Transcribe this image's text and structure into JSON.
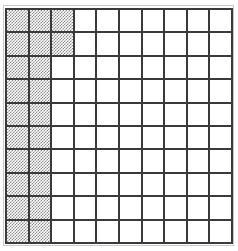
{
  "figure": {
    "type": "grid-area-model",
    "title": "",
    "columns": 10,
    "rows": 10,
    "total_cells": 100,
    "shaded_cells": 22,
    "unshaded_cells": 78,
    "fraction_shaded": "22/100",
    "decimal_shaded": "0.22",
    "percent_shaded": "22%"
  },
  "colors": {
    "grid_line": "#3a3a3a",
    "cell_fill": "#ffffff",
    "shade_fill": "#8d8d8d",
    "outer_frame": "#c9c9c9",
    "background": "#ffffff"
  },
  "chart_data": {
    "type": "heatmap",
    "title": "",
    "xlabel": "",
    "ylabel": "",
    "categories": [
      "1",
      "2",
      "3",
      "4",
      "5",
      "6",
      "7",
      "8",
      "9",
      "10"
    ],
    "row_labels": [
      "1",
      "2",
      "3",
      "4",
      "5",
      "6",
      "7",
      "8",
      "9",
      "10"
    ],
    "legend": [
      "shaded",
      "unshaded"
    ],
    "legend_position": "none",
    "grid": true,
    "shaded_per_row": [
      3,
      3,
      2,
      2,
      2,
      2,
      2,
      2,
      2,
      2
    ],
    "values": [
      [
        1,
        1,
        1,
        0,
        0,
        0,
        0,
        0,
        0,
        0
      ],
      [
        1,
        1,
        1,
        0,
        0,
        0,
        0,
        0,
        0,
        0
      ],
      [
        1,
        1,
        0,
        0,
        0,
        0,
        0,
        0,
        0,
        0
      ],
      [
        1,
        1,
        0,
        0,
        0,
        0,
        0,
        0,
        0,
        0
      ],
      [
        1,
        1,
        0,
        0,
        0,
        0,
        0,
        0,
        0,
        0
      ],
      [
        1,
        1,
        0,
        0,
        0,
        0,
        0,
        0,
        0,
        0
      ],
      [
        1,
        1,
        0,
        0,
        0,
        0,
        0,
        0,
        0,
        0
      ],
      [
        1,
        1,
        0,
        0,
        0,
        0,
        0,
        0,
        0,
        0
      ],
      [
        1,
        1,
        0,
        0,
        0,
        0,
        0,
        0,
        0,
        0
      ],
      [
        1,
        1,
        0,
        0,
        0,
        0,
        0,
        0,
        0,
        0
      ]
    ]
  }
}
